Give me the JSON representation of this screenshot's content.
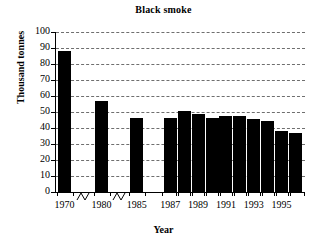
{
  "chart_data": {
    "type": "bar",
    "title": "Black smoke",
    "xlabel": "Year",
    "ylabel": "Thousand tonnes",
    "categories": [
      "1970",
      "1980",
      "1985",
      "1987",
      "1988",
      "1989",
      "1990",
      "1991",
      "1992",
      "1993",
      "1994",
      "1995",
      "1996"
    ],
    "values": [
      88,
      57,
      46,
      46,
      50.5,
      48.5,
      46.5,
      47.5,
      47.5,
      45.5,
      44.5,
      38,
      37
    ],
    "ylim": [
      0,
      100
    ],
    "ytick_values": [
      0,
      10,
      20,
      30,
      40,
      50,
      60,
      70,
      80,
      90,
      100
    ],
    "ytick_labels": [
      "0",
      "10",
      "20",
      "30",
      "40",
      "50",
      "60",
      "70",
      "80",
      "90",
      "100"
    ],
    "xtick_labels": [
      "1970",
      "1980",
      "1985",
      "1987",
      "1989",
      "1991",
      "1993",
      "1995"
    ],
    "grid": "horizontal-dashed",
    "legend": "none",
    "bar_color": "#000000",
    "grid_color": "#6f6f6f",
    "axis_color": "#000000",
    "axis_breaks": 2,
    "annotations": "Two zigzag axis-break marks on the x-axis: between 1970 and 1980, and between 1980 and 1985."
  }
}
